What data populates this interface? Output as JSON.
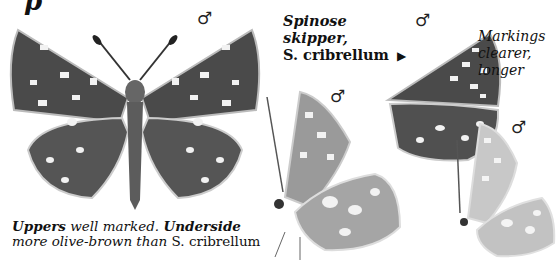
{
  "page_fragment": {
    "glyph": "p"
  },
  "sex_symbol": "♂",
  "species_label": {
    "line1": "Spinose",
    "line2": "skipper,",
    "line3": "S. cribrellum",
    "pointer": "▶"
  },
  "side_note": {
    "line1": "Markings",
    "line2": "clearer,",
    "line3": "longer"
  },
  "bottom_caption": {
    "bold1": "Uppers",
    "text1": " well marked. ",
    "bold2": "Underside",
    "text2": "more olive-brown than",
    "roman": " S. cribrellum"
  },
  "colors": {
    "wing_dark": "#4a4a4a",
    "wing_light": "#bdbdbd",
    "spots": "#f2f2f2"
  }
}
